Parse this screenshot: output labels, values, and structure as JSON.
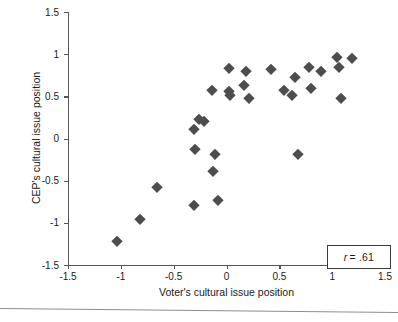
{
  "chart_data": {
    "type": "scatter",
    "title": "",
    "xlabel": "Voter's cultural issue position",
    "ylabel": "CEP's cultural issue position",
    "xlim": [
      -1.5,
      1.5
    ],
    "ylim": [
      -1.5,
      1.5
    ],
    "xticks": [
      "-1.5",
      "-1",
      "-0.5",
      "0",
      "0.5",
      "1",
      "1.5"
    ],
    "xtick_values": [
      -1.5,
      -1,
      -0.5,
      0,
      0.5,
      1,
      1.5
    ],
    "yticks": [
      "1.5",
      "1",
      "0.5",
      "0",
      "-0.5",
      "-1",
      "-1.5"
    ],
    "ytick_values": [
      1.5,
      1,
      0.5,
      0,
      -0.5,
      -1,
      -1.5
    ],
    "grid": false,
    "legend": null,
    "marker": "diamond",
    "marker_color": "#4d4d4d",
    "annotation": {
      "r_symbol": "r",
      "text": "= .61",
      "full_text": "r = .61",
      "value": 0.61
    },
    "points": [
      {
        "x": -1.04,
        "y": -1.21
      },
      {
        "x": -0.82,
        "y": -0.96
      },
      {
        "x": -0.66,
        "y": -0.58
      },
      {
        "x": -0.31,
        "y": -0.79
      },
      {
        "x": -0.31,
        "y": 0.11
      },
      {
        "x": -0.3,
        "y": -0.13
      },
      {
        "x": -0.26,
        "y": 0.23
      },
      {
        "x": -0.21,
        "y": 0.21
      },
      {
        "x": -0.14,
        "y": 0.58
      },
      {
        "x": -0.13,
        "y": -0.39
      },
      {
        "x": -0.11,
        "y": -0.18
      },
      {
        "x": -0.08,
        "y": -0.73
      },
      {
        "x": 0.02,
        "y": 0.84
      },
      {
        "x": 0.02,
        "y": 0.56
      },
      {
        "x": 0.03,
        "y": 0.52
      },
      {
        "x": 0.17,
        "y": 0.64
      },
      {
        "x": 0.18,
        "y": 0.8
      },
      {
        "x": 0.21,
        "y": 0.48
      },
      {
        "x": 0.42,
        "y": 0.83
      },
      {
        "x": 0.54,
        "y": 0.57
      },
      {
        "x": 0.62,
        "y": 0.52
      },
      {
        "x": 0.65,
        "y": 0.73
      },
      {
        "x": 0.68,
        "y": -0.18
      },
      {
        "x": 0.78,
        "y": 0.85
      },
      {
        "x": 0.8,
        "y": 0.6
      },
      {
        "x": 0.89,
        "y": 0.8
      },
      {
        "x": 1.05,
        "y": 0.97
      },
      {
        "x": 1.06,
        "y": 0.85
      },
      {
        "x": 1.08,
        "y": 0.48
      },
      {
        "x": 1.19,
        "y": 0.96
      }
    ]
  }
}
